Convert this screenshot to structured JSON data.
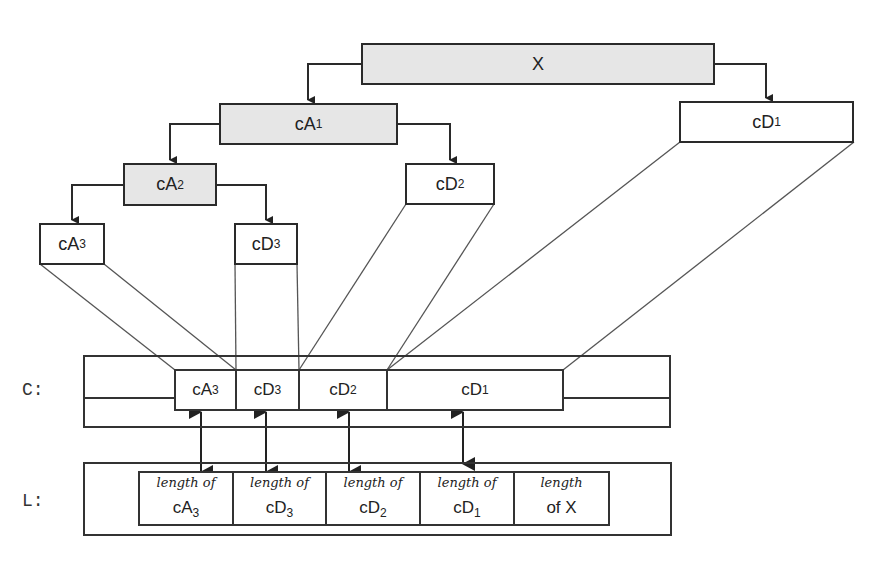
{
  "tree": {
    "root": {
      "base": "X",
      "sub": ""
    },
    "cA1": {
      "base": "cA",
      "sub": "1"
    },
    "cD1": {
      "base": "cD",
      "sub": "1"
    },
    "cA2": {
      "base": "cA",
      "sub": "2"
    },
    "cD2": {
      "base": "cD",
      "sub": "2"
    },
    "cA3": {
      "base": "cA",
      "sub": "3"
    },
    "cD3": {
      "base": "cD",
      "sub": "3"
    }
  },
  "c_row": {
    "label": "C:",
    "cells": [
      {
        "base": "cA",
        "sub": "3"
      },
      {
        "base": "cD",
        "sub": "3"
      },
      {
        "base": "cD",
        "sub": "2"
      },
      {
        "base": "cD",
        "sub": "1"
      }
    ]
  },
  "l_row": {
    "label": "L:",
    "cells": [
      {
        "prefix": "length of",
        "base": "cA",
        "sub": "3"
      },
      {
        "prefix": "length of",
        "base": "cD",
        "sub": "3"
      },
      {
        "prefix": "length of",
        "base": "cD",
        "sub": "2"
      },
      {
        "prefix": "length of",
        "base": "cD",
        "sub": "1"
      },
      {
        "prefix": "length",
        "base": "of X",
        "sub": ""
      }
    ]
  },
  "colors": {
    "shaded_box": "#e6e6e6",
    "line": "#2a2a2a",
    "connector": "#555555"
  }
}
